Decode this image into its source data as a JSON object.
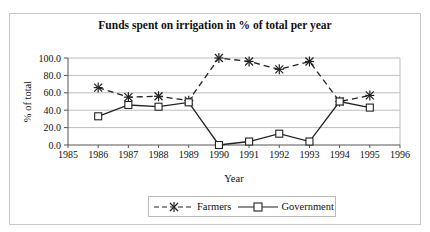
{
  "chart_data": {
    "type": "line",
    "title": "Funds spent on irrigation in % of total per year",
    "xlabel": "Year",
    "ylabel": "% of total",
    "x_ticks": [
      "1985",
      "1986",
      "1987",
      "1988",
      "1989",
      "1990",
      "1991",
      "1992",
      "1993",
      "1994",
      "1995",
      "1996"
    ],
    "y_ticks": [
      "0.0",
      "20.0",
      "40.0",
      "60.0",
      "80.0",
      "100.0"
    ],
    "xlim": [
      1985,
      1996
    ],
    "ylim": [
      0,
      100
    ],
    "grid": "horizontal",
    "legend_position": "bottom",
    "x": [
      1986,
      1987,
      1988,
      1989,
      1990,
      1991,
      1992,
      1993,
      1994,
      1995
    ],
    "series": [
      {
        "name": "Farmers",
        "style": "dashed",
        "marker": "asterisk",
        "values": [
          66,
          55,
          56,
          51,
          100,
          96,
          87,
          96,
          50,
          57
        ]
      },
      {
        "name": "Government",
        "style": "solid",
        "marker": "square",
        "values": [
          33,
          46,
          44,
          49,
          0,
          4,
          13,
          4,
          50,
          43
        ]
      }
    ]
  },
  "legend": {
    "farmers": "Farmers",
    "government": "Government"
  },
  "colors": {
    "line": "#222222",
    "grid": "#bdbdbd",
    "frame": "#c8c8c8"
  }
}
